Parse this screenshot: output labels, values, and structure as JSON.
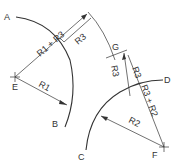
{
  "diagram": {
    "type": "tangent-arc construction",
    "points": {
      "A": "A",
      "B": "B",
      "C": "C",
      "D": "D",
      "E": "E",
      "F": "F",
      "G": "G"
    },
    "dimensions": {
      "r1_plus_r3": "R1 + R3",
      "r3_upper": "R3",
      "r3_mid_left": "R3",
      "r3_mid_right": "R3",
      "r1": "R1",
      "r2_plus_r3": "R3 + R2",
      "r2": "R2"
    },
    "colors": {
      "ink": "#333333",
      "background": "#ffffff"
    }
  }
}
